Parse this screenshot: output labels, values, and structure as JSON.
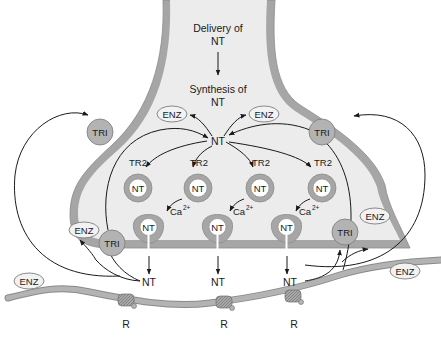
{
  "diagram": {
    "colors": {
      "membrane": "#a6a6a6",
      "membrane_edge": "#8a8a8a",
      "cytoplasm": "#ececec",
      "transporter_fill": "#b3b3b3",
      "enzyme_fill": "#f2f2f2",
      "receptor_fill": "#9e9e9e",
      "text": "#1a1a1a",
      "background": "#ffffff"
    },
    "labels": {
      "delivery_line1": "Delivery of",
      "delivery_line2": "NT",
      "synthesis_line1": "Synthesis of",
      "synthesis_line2": "NT",
      "central_nt": "NT",
      "enz": "ENZ",
      "tri": "TRI",
      "tr2": "TR2",
      "nt": "NT",
      "ca": "Ca",
      "ca_charge": "2+",
      "receptor": "R"
    },
    "vesicles": [
      {
        "id": "v1",
        "transporter": "TR2",
        "content": "NT"
      },
      {
        "id": "v2",
        "transporter": "TR2",
        "content": "NT"
      },
      {
        "id": "v3",
        "transporter": "TR2",
        "content": "NT"
      },
      {
        "id": "v4",
        "transporter": "TR2",
        "content": "NT"
      }
    ],
    "release_sites": [
      {
        "id": "r1",
        "trigger": "Ca2+",
        "content": "NT",
        "released": "NT",
        "receptor": "R"
      },
      {
        "id": "r2",
        "trigger": "Ca2+",
        "content": "NT",
        "released": "NT",
        "receptor": "R"
      },
      {
        "id": "r3",
        "trigger": "Ca2+",
        "content": "NT",
        "released": "NT",
        "receptor": "R"
      }
    ],
    "transporters_tri": [
      "upper-left",
      "upper-right",
      "lower-left",
      "lower-right"
    ],
    "enzymes_enz": [
      "cytoplasm-left",
      "cytoplasm-right",
      "lower-left-terminal",
      "lower-right-terminal",
      "postsynaptic-left",
      "postsynaptic-right"
    ]
  }
}
